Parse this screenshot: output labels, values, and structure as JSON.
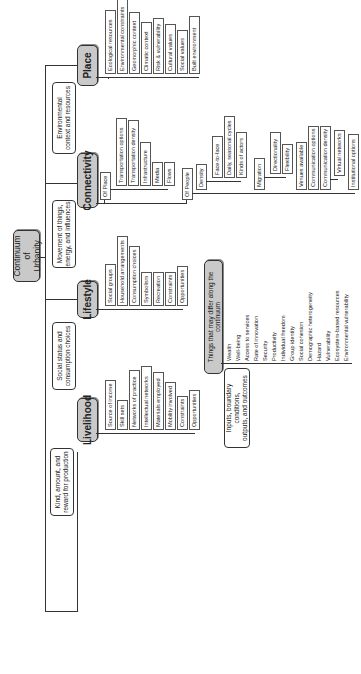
{
  "root": {
    "label_line1": "Continuum of",
    "label_line2": "Urbanity"
  },
  "branches": {
    "place": {
      "label": "Place",
      "callout": [
        "Environmental",
        "context and resources"
      ],
      "items": [
        "Ecological resources",
        "Environmental constraints",
        "Geomorphic context",
        "Climatic context",
        "Risk & vulnerability",
        "Cultural values",
        "Social values",
        "Built environment"
      ]
    },
    "connectivity": {
      "label": "Connectivity",
      "callout": [
        "Movement of things,",
        "energy, and influences"
      ],
      "of_place": {
        "label": "Of Place",
        "items": [
          "Transportation options",
          "Transportation density",
          "Infrastructure",
          "Media",
          "Flows"
        ]
      },
      "of_people": {
        "label": "Of People",
        "density": {
          "label": "Density",
          "items": [
            "Face-to-face",
            "Daily, seasonal cycles",
            "Kinds of actors"
          ]
        },
        "migration": {
          "label": "Migration",
          "items": [
            "Directionality",
            "Flexibility"
          ]
        },
        "other_items": [
          "Venues available",
          "Communication options",
          "Communication density"
        ],
        "virtual": {
          "label": "Virtual networks"
        },
        "institutional": {
          "label": "Institutional options"
        }
      }
    },
    "lifestyle": {
      "label": "Lifestyle",
      "callout": [
        "Social status and",
        "consumption choices"
      ],
      "items": [
        "Social groups",
        "Household arrangements",
        "Consumption choices",
        "Symbolism",
        "Recreation",
        "Constraints",
        "Opportunities"
      ]
    },
    "livelihood": {
      "label": "Livelihood",
      "callout": [
        "Kind, amount, and",
        "reward for production"
      ],
      "items": [
        "Source of income",
        "Skill sets",
        "Networks of practice",
        "Intellectual networks",
        "Materials employed",
        "Mobility involved",
        "Constraints",
        "Opportunities"
      ]
    }
  },
  "differ": {
    "label": "Things that may differ along the continuum",
    "callout": [
      "Inputs, boundary conditions,",
      "outputs, and outcomes"
    ],
    "items": [
      "Wealth",
      "Well-being",
      "Access to services",
      "Rate of innovation",
      "Security",
      "Productivity",
      "Individual freedom",
      "Group identity",
      "Social cohesion",
      "Demographic heterogeneity",
      "Hazard",
      "Vulnerability",
      "Ecosystem-based resources",
      "Environmental vulnerability"
    ]
  }
}
